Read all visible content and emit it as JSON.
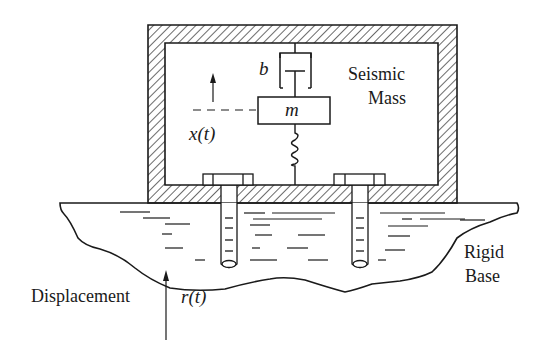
{
  "diagram": {
    "type": "seismic-accelerometer-schematic",
    "labels": {
      "damper": "b",
      "mass": "m",
      "mass_displacement": "x(t)",
      "seismic_mass_line1": "Seismic",
      "seismic_mass_line2": "Mass",
      "rigid_base_line1": "Rigid",
      "rigid_base_line2": "Base",
      "displacement": "Displacement",
      "base_displacement": "r(t)"
    },
    "colors": {
      "ink": "#1a1a1a",
      "background": "#ffffff"
    }
  }
}
